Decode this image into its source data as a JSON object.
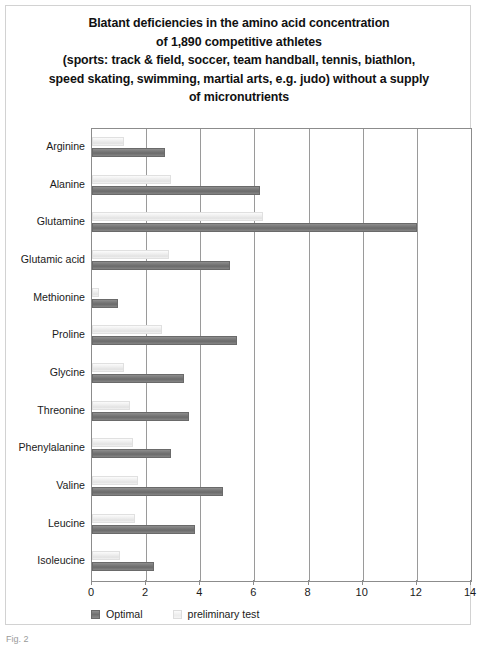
{
  "figure": {
    "caption": "Fig. 2"
  },
  "legend": {
    "position": "bottom-left",
    "items": [
      {
        "label": "Optimal",
        "swatch": "dark",
        "color": "#7b7b7b"
      },
      {
        "label": "preliminary test",
        "swatch": "light",
        "color": "#ededed"
      }
    ]
  },
  "chart_data": {
    "type": "bar",
    "orientation": "horizontal",
    "title_lines": [
      "Blatant deficiencies in the amino acid concentration",
      "of 1,890 competitive athletes",
      "(sports: track & field, soccer, team handball, tennis, biathlon,",
      "speed skating, swimming, martial arts, e.g. judo) without a supply",
      "of micronutrients"
    ],
    "xlabel": "",
    "ylabel": "",
    "xlim": [
      0,
      14
    ],
    "xticks": [
      0,
      2,
      4,
      6,
      8,
      10,
      12,
      14
    ],
    "grid": true,
    "grid_axis": "x",
    "categories": [
      "Arginine",
      "Alanine",
      "Glutamine",
      "Glutamic acid",
      "Methionine",
      "Proline",
      "Glycine",
      "Threonine",
      "Phenylalanine",
      "Valine",
      "Leucine",
      "Isoleucine"
    ],
    "series": [
      {
        "name": "Optimal",
        "color": "#7b7b7b",
        "values": [
          2.7,
          6.2,
          12.0,
          5.1,
          0.95,
          5.35,
          3.4,
          3.6,
          2.9,
          4.85,
          3.8,
          2.3
        ]
      },
      {
        "name": "preliminary test",
        "color": "#ededed",
        "values": [
          1.2,
          2.9,
          6.3,
          2.85,
          0.25,
          2.6,
          1.2,
          1.4,
          1.5,
          1.7,
          1.6,
          1.05
        ]
      }
    ]
  }
}
